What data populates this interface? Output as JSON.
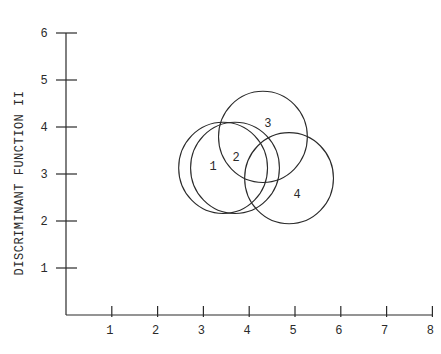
{
  "chart_data": {
    "type": "scatter",
    "title": "",
    "xlabel": "",
    "ylabel": "DISCRIMINANT FUNCTION II",
    "xlim": [
      0,
      8
    ],
    "ylim": [
      0,
      6
    ],
    "x_ticks": [
      "1",
      "2",
      "3",
      "4",
      "5",
      "6",
      "7",
      "8"
    ],
    "y_ticks": [
      "1",
      "2",
      "3",
      "4",
      "5",
      "6"
    ],
    "grid": false,
    "legend": null,
    "series": [
      {
        "name": "1",
        "x": 3.43,
        "y": 3.13,
        "radius": 0.97
      },
      {
        "name": "2",
        "x": 3.69,
        "y": 3.13,
        "radius": 0.97
      },
      {
        "name": "3",
        "x": 4.3,
        "y": 3.79,
        "radius": 0.97
      },
      {
        "name": "4",
        "x": 4.87,
        "y": 2.91,
        "radius": 0.97
      }
    ]
  },
  "colors": {
    "ink": "#2a2a2a",
    "background": "#ffffff"
  }
}
